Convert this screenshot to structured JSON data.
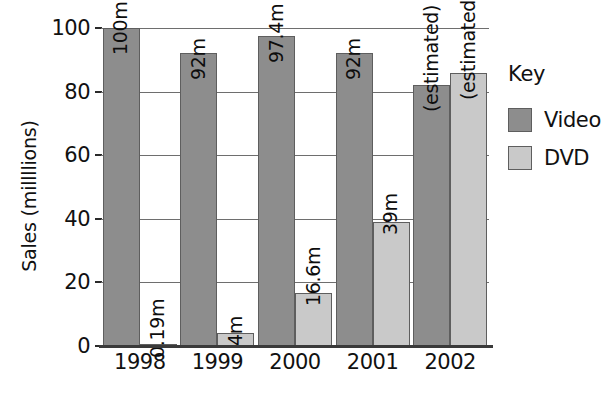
{
  "chart_data": {
    "type": "bar",
    "title": "",
    "xlabel": "",
    "ylabel": "Sales (millllions)",
    "ylim": [
      0,
      100
    ],
    "yticks": [
      0,
      20,
      40,
      60,
      80,
      100
    ],
    "grid": true,
    "legend_position": "right",
    "legend_title": "Key",
    "categories": [
      "1998",
      "1999",
      "2000",
      "2001",
      "2002"
    ],
    "series": [
      {
        "name": "Video",
        "color": "#8d8d8d",
        "values": [
          100,
          92,
          97.4,
          92,
          82
        ],
        "labels": [
          "100m",
          "92m",
          "97.4m",
          "92m",
          "(estimated) 82m"
        ]
      },
      {
        "name": "DVD",
        "color": "#c9c9c9",
        "values": [
          0.19,
          4,
          16.6,
          39,
          86
        ],
        "labels": [
          "0.19m",
          "4m",
          "16.6m",
          "39m",
          "(estimated) 86m"
        ]
      }
    ]
  },
  "axis": {
    "y_tick_labels": [
      "0",
      "20",
      "40",
      "60",
      "80",
      "100"
    ],
    "x_tick_labels": [
      "1998",
      "1999",
      "2000",
      "2001",
      "2002"
    ],
    "y_title": "Sales (millllions)"
  },
  "legend": {
    "title": "Key",
    "items": [
      {
        "label": "Video",
        "color": "#8d8d8d"
      },
      {
        "label": "DVD",
        "color": "#c9c9c9"
      }
    ]
  }
}
